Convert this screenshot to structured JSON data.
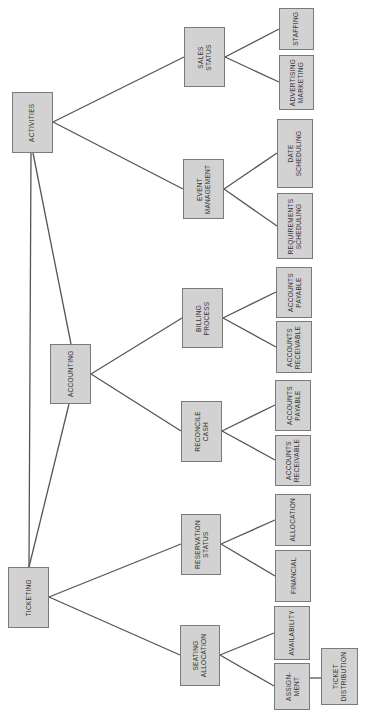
{
  "diagram": {
    "type": "hierarchy-tree",
    "orientation": "rotated-90-ccw",
    "colors": {
      "box_fill": "#d2d2d2",
      "box_border": "#7a7a7a",
      "line": "#555555",
      "text": "#333333"
    },
    "nodes": {
      "activities": {
        "label": "ACTIVITIES"
      },
      "accounting": {
        "label": "ACCOUNTING"
      },
      "ticketing": {
        "label": "TICKETING"
      },
      "sales_status": {
        "label": "SALES\nSTATUS"
      },
      "event_management": {
        "label": "EVENT\nMANAGEMENT"
      },
      "billing_process": {
        "label": "BILLING\nPROCESS"
      },
      "reconcile_cash": {
        "label": "RECONCILE\nCASH"
      },
      "reservation_status": {
        "label": "RESERVATION\nSTATUS"
      },
      "seating_allocation": {
        "label": "SEATING\nALLOCATION"
      },
      "staffing": {
        "label": "STAFFING"
      },
      "advertising_marketing": {
        "label": "ADVERTISING\nMARKETING"
      },
      "date_scheduling": {
        "label": "DATE\nSCHEDULING"
      },
      "requirements_scheduling": {
        "label": "REQUIREMENTS\nSCHEDULING"
      },
      "billing_accounts_payable": {
        "label": "ACCOUNTS\nPAYABLE"
      },
      "billing_accounts_receivable": {
        "label": "ACCOUNTS\nRECEIVABLE"
      },
      "reconcile_accounts_payable": {
        "label": "ACCOUNTS\nPAYABLE"
      },
      "reconcile_accounts_receivable": {
        "label": "ACCOUNTS\nRECEIVABLE"
      },
      "allocation": {
        "label": "ALLOCATION"
      },
      "financial": {
        "label": "FINANCIAL"
      },
      "availability": {
        "label": "AVAILABILITY"
      },
      "assignment": {
        "label": "ASSIGN-\nMENT"
      },
      "ticket_distribution": {
        "label": "TICKET\nDISTRIBUTION"
      }
    },
    "edges": [
      [
        "activities",
        "accounting"
      ],
      [
        "activities",
        "ticketing"
      ],
      [
        "accounting",
        "ticketing"
      ],
      [
        "activities",
        "sales_status"
      ],
      [
        "activities",
        "event_management"
      ],
      [
        "accounting",
        "billing_process"
      ],
      [
        "accounting",
        "reconcile_cash"
      ],
      [
        "ticketing",
        "reservation_status"
      ],
      [
        "ticketing",
        "seating_allocation"
      ],
      [
        "sales_status",
        "staffing"
      ],
      [
        "sales_status",
        "advertising_marketing"
      ],
      [
        "event_management",
        "date_scheduling"
      ],
      [
        "event_management",
        "requirements_scheduling"
      ],
      [
        "billing_process",
        "billing_accounts_payable"
      ],
      [
        "billing_process",
        "billing_accounts_receivable"
      ],
      [
        "reconcile_cash",
        "reconcile_accounts_payable"
      ],
      [
        "reconcile_cash",
        "reconcile_accounts_receivable"
      ],
      [
        "reservation_status",
        "allocation"
      ],
      [
        "reservation_status",
        "financial"
      ],
      [
        "seating_allocation",
        "availability"
      ],
      [
        "seating_allocation",
        "assignment"
      ],
      [
        "assignment",
        "ticket_distribution"
      ]
    ]
  }
}
